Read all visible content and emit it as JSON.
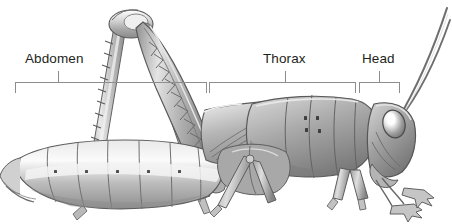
{
  "figure": {
    "style": "grayscale pencil illustration",
    "background_color": "#ffffff",
    "width": 452,
    "height": 224
  },
  "labels": [
    {
      "id": "abdomen",
      "text": "Abdomen",
      "x": 25,
      "y": 52,
      "tick_x": 58,
      "bracket": {
        "x": 15,
        "y": 82,
        "width": 191,
        "depth": 11
      }
    },
    {
      "id": "thorax",
      "text": "Thorax",
      "x": 263,
      "y": 52,
      "tick_x": 285,
      "bracket": {
        "x": 209,
        "y": 82,
        "width": 147,
        "depth": 11
      }
    },
    {
      "id": "head",
      "text": "Head",
      "x": 362,
      "y": 52,
      "tick_x": 379,
      "bracket": {
        "x": 359,
        "y": 82,
        "width": 41,
        "depth": 11
      }
    }
  ],
  "colors": {
    "text": "#231f20",
    "leader_line": "#8d8d8d",
    "ink_dark": "#4a4a4a",
    "ink_mid": "#9a9a9a",
    "ink_light": "#cfcfcf",
    "highlight": "#ffffff"
  },
  "anatomy_parts": [
    "abdomen",
    "abdominal-segments",
    "spiracles",
    "ovipositor",
    "thorax",
    "pronotum",
    "forewing",
    "hind-femur",
    "hind-tibia",
    "tibial-spines",
    "tarsus",
    "foreleg",
    "midleg",
    "head",
    "compound-eye",
    "antenna",
    "mandible"
  ]
}
